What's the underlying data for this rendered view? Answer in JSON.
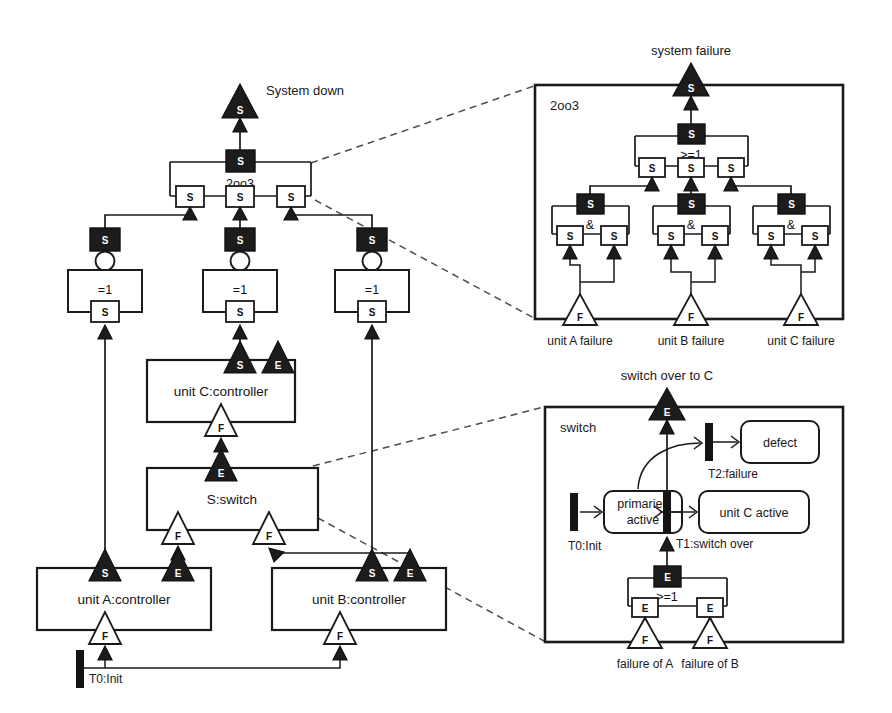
{
  "figure": {
    "background": "#ffffff",
    "ink": "#1a1a1a",
    "fill_dark": "#1c1c1c"
  },
  "main": {
    "top_event_label": "System down",
    "top_gate_name": "2oo3",
    "top_gate_port": "S",
    "voter_inputs": [
      "S",
      "S",
      "S"
    ],
    "xor_gates": [
      {
        "out_port": "S",
        "symbol": "=1",
        "in_port": "S",
        "inverted": true
      },
      {
        "out_port": "S",
        "symbol": "=1",
        "in_port": "S",
        "inverted": true
      },
      {
        "out_port": "S",
        "symbol": "=1",
        "in_port": "S",
        "inverted": true
      }
    ],
    "components": [
      {
        "name": "unit A:controller",
        "top_ports": [
          {
            "label": "S",
            "kind": "dark"
          },
          {
            "label": "E",
            "kind": "dark"
          }
        ],
        "bottom_ports": [
          {
            "label": "F",
            "kind": "light"
          }
        ]
      },
      {
        "name": "unit B:controller",
        "top_ports": [
          {
            "label": "S",
            "kind": "dark"
          },
          {
            "label": "E",
            "kind": "dark"
          }
        ],
        "bottom_ports": [
          {
            "label": "F",
            "kind": "light"
          }
        ]
      },
      {
        "name": "unit C:controller",
        "top_ports": [
          {
            "label": "S",
            "kind": "dark"
          },
          {
            "label": "E",
            "kind": "dark"
          }
        ],
        "bottom_ports": [
          {
            "label": "F",
            "kind": "light"
          }
        ]
      },
      {
        "name": "S:switch",
        "top_ports": [
          {
            "label": "E",
            "kind": "dark"
          }
        ],
        "bottom_ports": [
          {
            "label": "F",
            "kind": "light"
          },
          {
            "label": "F",
            "kind": "light"
          }
        ]
      }
    ],
    "init_transition": "T0:Init"
  },
  "inset_fault_tree": {
    "panel_label": "2oo3",
    "top_event_label": "system failure",
    "top_port": "S",
    "or_gate": {
      "out_port": "S",
      "symbol": ">=1",
      "inputs": [
        "S",
        "S",
        "S"
      ]
    },
    "and_gates": [
      {
        "out_port": "S",
        "symbol": "&",
        "inputs": [
          "S",
          "S"
        ]
      },
      {
        "out_port": "S",
        "symbol": "&",
        "inputs": [
          "S",
          "S"
        ]
      },
      {
        "out_port": "S",
        "symbol": "&",
        "inputs": [
          "S",
          "S"
        ]
      }
    ],
    "basic_events": [
      {
        "port": "F",
        "label": "unit A failure"
      },
      {
        "port": "F",
        "label": "unit B failure"
      },
      {
        "port": "F",
        "label": "unit C failure"
      }
    ]
  },
  "inset_switch": {
    "panel_label": "switch",
    "out_event_label": "switch over to C",
    "out_port": "E",
    "states": [
      {
        "id": "primaries-active",
        "label": "primaries\nactive",
        "line1": "primaries",
        "line2": "active"
      },
      {
        "id": "defect",
        "label": "defect"
      },
      {
        "id": "unit-c-active",
        "label": "unit C active"
      }
    ],
    "transitions": [
      {
        "id": "t0",
        "label": "T0:Init"
      },
      {
        "id": "t1",
        "label": "T1:switch over"
      },
      {
        "id": "t2",
        "label": "T2:failure"
      }
    ],
    "or_gate": {
      "out_port": "E",
      "symbol": ">=1",
      "inputs": [
        "E",
        "E"
      ]
    },
    "basic_events": [
      {
        "port": "F",
        "label": "failure of A"
      },
      {
        "port": "F",
        "label": "failure of B"
      }
    ]
  }
}
